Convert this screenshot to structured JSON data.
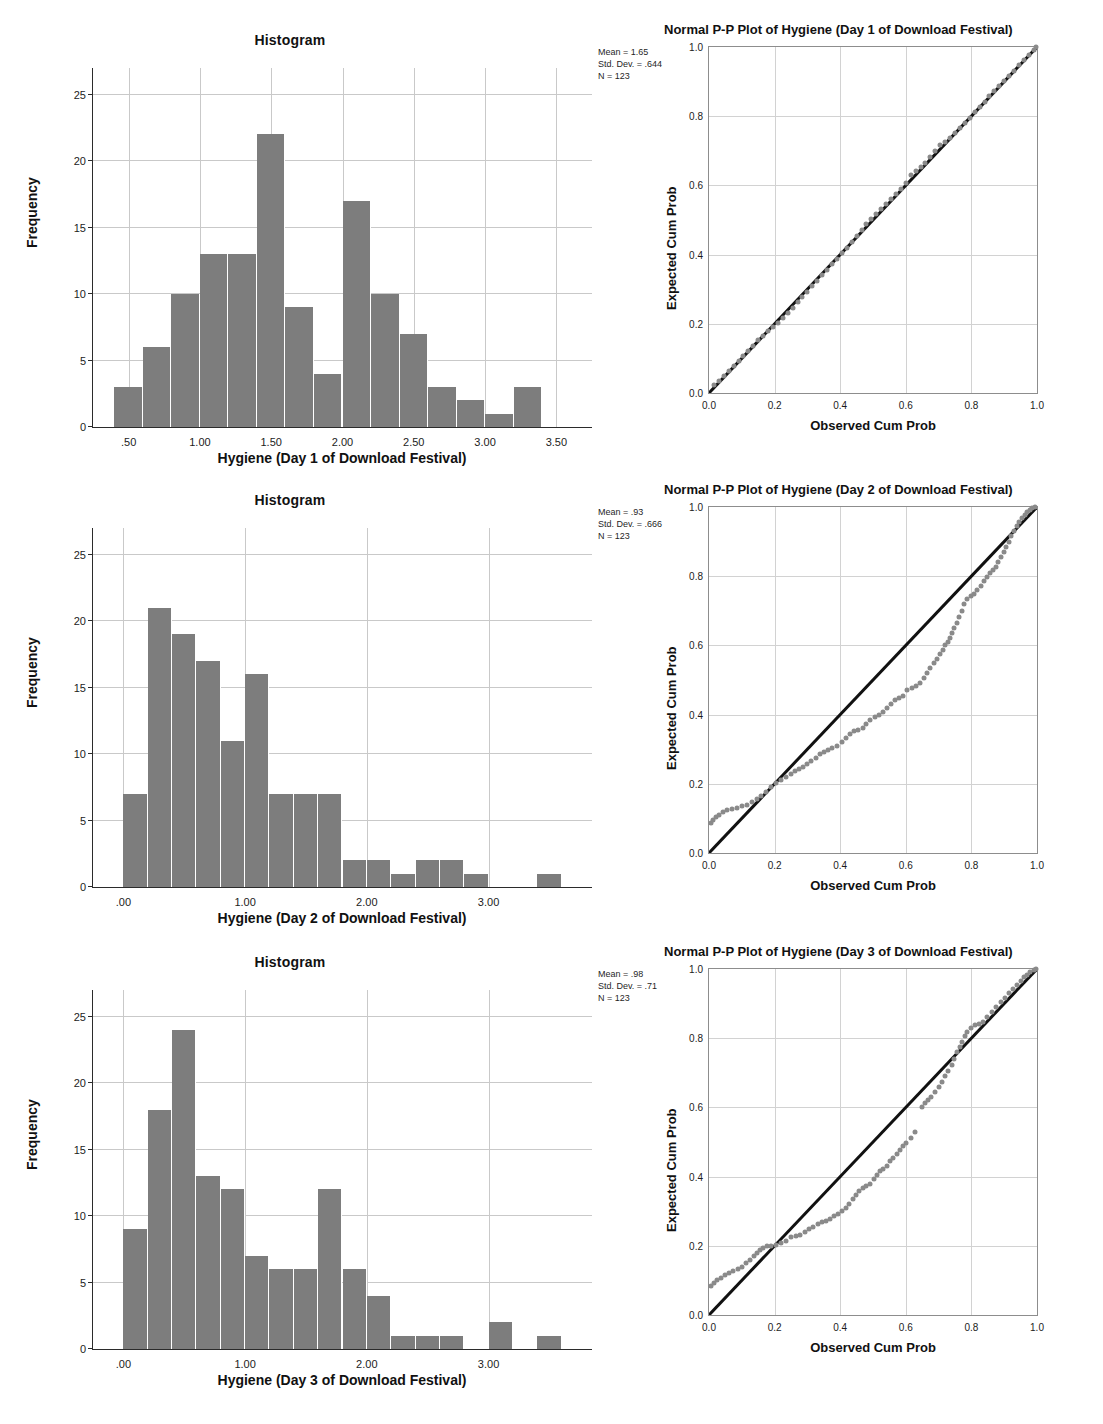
{
  "panels": [
    {
      "histogram": {
        "title": "Histogram",
        "xlabel": "Hygiene (Day 1 of Download Festival)",
        "ylabel": "Frequency",
        "stats": {
          "mean": "Mean = 1.65",
          "sd": "Std. Dev. = .644",
          "n": "N = 123"
        }
      },
      "ppplot": {
        "title": "Normal P-P Plot of Hygiene (Day 1 of Download Festival)",
        "xlabel": "Observed Cum Prob",
        "ylabel": "Expected Cum Prob"
      }
    },
    {
      "histogram": {
        "title": "Histogram",
        "xlabel": "Hygiene (Day 2 of Download Festival)",
        "ylabel": "Frequency",
        "stats": {
          "mean": "Mean = .93",
          "sd": "Std. Dev. = .666",
          "n": "N = 123"
        }
      },
      "ppplot": {
        "title": "Normal P-P Plot of Hygiene (Day 2 of Download Festival)",
        "xlabel": "Observed Cum Prob",
        "ylabel": "Expected Cum Prob"
      }
    },
    {
      "histogram": {
        "title": "Histogram",
        "xlabel": "Hygiene (Day 3 of Download Festival)",
        "ylabel": "Frequency",
        "stats": {
          "mean": "Mean = .98",
          "sd": "Std. Dev. = .71",
          "n": "N = 123"
        }
      },
      "ppplot": {
        "title": "Normal P-P Plot of Hygiene (Day 3 of Download Festival)",
        "xlabel": "Observed Cum Prob",
        "ylabel": "Expected Cum Prob"
      }
    }
  ],
  "chart_data": [
    {
      "type": "bar",
      "title": "Histogram",
      "xlabel": "Hygiene (Day 1 of Download Festival)",
      "ylabel": "Frequency",
      "ylim": [
        0,
        27
      ],
      "yticks": [
        0,
        5,
        10,
        15,
        20,
        25
      ],
      "xlim": [
        0.25,
        3.75
      ],
      "xticks": [
        0.5,
        1.0,
        1.5,
        2.0,
        2.5,
        3.0,
        3.5
      ],
      "xticklabels": [
        ".50",
        "1.00",
        "1.50",
        "2.00",
        "2.50",
        "3.00",
        "3.50"
      ],
      "bin_width": 0.2,
      "bin_starts": [
        0.4,
        0.6,
        0.8,
        1.0,
        1.2,
        1.4,
        1.6,
        1.8,
        2.0,
        2.2,
        2.4,
        2.6,
        2.8,
        3.0,
        3.2
      ],
      "values": [
        3,
        6,
        10,
        13,
        13,
        22,
        9,
        4,
        17,
        10,
        7,
        3,
        2,
        1,
        3
      ],
      "grid": true,
      "annotation": [
        "Mean = 1.65",
        "Std. Dev. = .644",
        "N = 123"
      ]
    },
    {
      "type": "scatter",
      "title": "Normal P-P Plot of Hygiene (Day 1 of Download Festival)",
      "xlabel": "Observed Cum Prob",
      "ylabel": "Expected Cum Prob",
      "xlim": [
        0.0,
        1.0
      ],
      "ylim": [
        0.0,
        1.0
      ],
      "xticks": [
        0.0,
        0.2,
        0.4,
        0.6,
        0.8,
        1.0
      ],
      "yticks": [
        0.0,
        0.2,
        0.4,
        0.6,
        0.8,
        1.0
      ],
      "grid": true,
      "reference_line": [
        [
          0,
          0
        ],
        [
          1,
          1
        ]
      ],
      "points": [
        [
          0.015,
          0.022
        ],
        [
          0.03,
          0.035
        ],
        [
          0.045,
          0.05
        ],
        [
          0.06,
          0.064
        ],
        [
          0.075,
          0.078
        ],
        [
          0.09,
          0.092
        ],
        [
          0.105,
          0.107
        ],
        [
          0.12,
          0.122
        ],
        [
          0.135,
          0.137
        ],
        [
          0.15,
          0.152
        ],
        [
          0.165,
          0.166
        ],
        [
          0.18,
          0.178
        ],
        [
          0.195,
          0.19
        ],
        [
          0.21,
          0.203
        ],
        [
          0.225,
          0.217
        ],
        [
          0.24,
          0.232
        ],
        [
          0.255,
          0.247
        ],
        [
          0.27,
          0.262
        ],
        [
          0.285,
          0.277
        ],
        [
          0.3,
          0.292
        ],
        [
          0.315,
          0.308
        ],
        [
          0.33,
          0.324
        ],
        [
          0.345,
          0.34
        ],
        [
          0.36,
          0.356
        ],
        [
          0.375,
          0.372
        ],
        [
          0.39,
          0.388
        ],
        [
          0.405,
          0.404
        ],
        [
          0.42,
          0.42
        ],
        [
          0.435,
          0.437
        ],
        [
          0.45,
          0.454
        ],
        [
          0.465,
          0.471
        ],
        [
          0.48,
          0.488
        ],
        [
          0.495,
          0.503
        ],
        [
          0.51,
          0.517
        ],
        [
          0.525,
          0.531
        ],
        [
          0.54,
          0.545
        ],
        [
          0.555,
          0.56
        ],
        [
          0.57,
          0.574
        ],
        [
          0.585,
          0.59
        ],
        [
          0.6,
          0.608
        ],
        [
          0.615,
          0.63
        ],
        [
          0.63,
          0.642
        ],
        [
          0.645,
          0.652
        ],
        [
          0.66,
          0.666
        ],
        [
          0.675,
          0.682
        ],
        [
          0.69,
          0.7
        ],
        [
          0.705,
          0.716
        ],
        [
          0.72,
          0.726
        ],
        [
          0.735,
          0.738
        ],
        [
          0.75,
          0.752
        ],
        [
          0.765,
          0.766
        ],
        [
          0.78,
          0.781
        ],
        [
          0.795,
          0.796
        ],
        [
          0.81,
          0.812
        ],
        [
          0.825,
          0.827
        ],
        [
          0.84,
          0.842
        ],
        [
          0.855,
          0.857
        ],
        [
          0.87,
          0.872
        ],
        [
          0.885,
          0.887
        ],
        [
          0.9,
          0.902
        ],
        [
          0.915,
          0.917
        ],
        [
          0.93,
          0.932
        ],
        [
          0.945,
          0.947
        ],
        [
          0.96,
          0.962
        ],
        [
          0.975,
          0.977
        ],
        [
          0.99,
          0.992
        ],
        [
          0.998,
          1.0
        ]
      ]
    },
    {
      "type": "bar",
      "title": "Histogram",
      "xlabel": "Hygiene (Day 2 of Download Festival)",
      "ylabel": "Frequency",
      "ylim": [
        0,
        27
      ],
      "yticks": [
        0,
        5,
        10,
        15,
        20,
        25
      ],
      "xlim": [
        -0.25,
        3.85
      ],
      "xticks": [
        0.0,
        1.0,
        2.0,
        3.0
      ],
      "xticklabels": [
        ".00",
        "1.00",
        "2.00",
        "3.00"
      ],
      "bin_width": 0.2,
      "bin_starts": [
        0.0,
        0.2,
        0.4,
        0.6,
        0.8,
        1.0,
        1.2,
        1.4,
        1.6,
        1.8,
        2.0,
        2.2,
        2.4,
        2.6,
        2.8,
        3.4
      ],
      "values": [
        7,
        21,
        19,
        17,
        11,
        16,
        7,
        7,
        7,
        2,
        2,
        1,
        2,
        2,
        1,
        1
      ],
      "grid": true,
      "annotation": [
        "Mean = .93",
        "Std. Dev. = .666",
        "N = 123"
      ]
    },
    {
      "type": "scatter",
      "title": "Normal P-P Plot of Hygiene (Day 2 of Download Festival)",
      "xlabel": "Observed Cum Prob",
      "ylabel": "Expected Cum Prob",
      "xlim": [
        0.0,
        1.0
      ],
      "ylim": [
        0.0,
        1.0
      ],
      "xticks": [
        0.0,
        0.2,
        0.4,
        0.6,
        0.8,
        1.0
      ],
      "yticks": [
        0.0,
        0.2,
        0.4,
        0.6,
        0.8,
        1.0
      ],
      "grid": true,
      "reference_line": [
        [
          0,
          0
        ],
        [
          1,
          1
        ]
      ],
      "points": [
        [
          0.005,
          0.088
        ],
        [
          0.012,
          0.095
        ],
        [
          0.02,
          0.103
        ],
        [
          0.03,
          0.11
        ],
        [
          0.042,
          0.118
        ],
        [
          0.055,
          0.124
        ],
        [
          0.07,
          0.128
        ],
        [
          0.085,
          0.131
        ],
        [
          0.1,
          0.135
        ],
        [
          0.115,
          0.14
        ],
        [
          0.13,
          0.148
        ],
        [
          0.145,
          0.157
        ],
        [
          0.16,
          0.166
        ],
        [
          0.175,
          0.177
        ],
        [
          0.19,
          0.19
        ],
        [
          0.205,
          0.203
        ],
        [
          0.22,
          0.212
        ],
        [
          0.235,
          0.22
        ],
        [
          0.25,
          0.228
        ],
        [
          0.262,
          0.236
        ],
        [
          0.275,
          0.243
        ],
        [
          0.288,
          0.25
        ],
        [
          0.3,
          0.258
        ],
        [
          0.312,
          0.267
        ],
        [
          0.325,
          0.276
        ],
        [
          0.338,
          0.285
        ],
        [
          0.35,
          0.292
        ],
        [
          0.362,
          0.298
        ],
        [
          0.375,
          0.303
        ],
        [
          0.39,
          0.31
        ],
        [
          0.405,
          0.32
        ],
        [
          0.418,
          0.332
        ],
        [
          0.43,
          0.344
        ],
        [
          0.442,
          0.352
        ],
        [
          0.455,
          0.356
        ],
        [
          0.468,
          0.362
        ],
        [
          0.48,
          0.372
        ],
        [
          0.492,
          0.383
        ],
        [
          0.505,
          0.393
        ],
        [
          0.518,
          0.4
        ],
        [
          0.53,
          0.408
        ],
        [
          0.542,
          0.42
        ],
        [
          0.555,
          0.432
        ],
        [
          0.568,
          0.441
        ],
        [
          0.58,
          0.447
        ],
        [
          0.592,
          0.455
        ],
        [
          0.605,
          0.47
        ],
        [
          0.618,
          0.478
        ],
        [
          0.63,
          0.483
        ],
        [
          0.642,
          0.492
        ],
        [
          0.655,
          0.507
        ],
        [
          0.665,
          0.52
        ],
        [
          0.675,
          0.535
        ],
        [
          0.685,
          0.548
        ],
        [
          0.695,
          0.561
        ],
        [
          0.705,
          0.575
        ],
        [
          0.712,
          0.588
        ],
        [
          0.72,
          0.6
        ],
        [
          0.728,
          0.61
        ],
        [
          0.735,
          0.62
        ],
        [
          0.742,
          0.635
        ],
        [
          0.748,
          0.65
        ],
        [
          0.755,
          0.665
        ],
        [
          0.762,
          0.682
        ],
        [
          0.77,
          0.7
        ],
        [
          0.778,
          0.72
        ],
        [
          0.788,
          0.733
        ],
        [
          0.798,
          0.742
        ],
        [
          0.808,
          0.75
        ],
        [
          0.818,
          0.76
        ],
        [
          0.828,
          0.772
        ],
        [
          0.838,
          0.785
        ],
        [
          0.848,
          0.797
        ],
        [
          0.858,
          0.808
        ],
        [
          0.866,
          0.818
        ],
        [
          0.874,
          0.828
        ],
        [
          0.882,
          0.84
        ],
        [
          0.89,
          0.855
        ],
        [
          0.898,
          0.87
        ],
        [
          0.906,
          0.885
        ],
        [
          0.914,
          0.9
        ],
        [
          0.922,
          0.915
        ],
        [
          0.93,
          0.93
        ],
        [
          0.938,
          0.944
        ],
        [
          0.946,
          0.957
        ],
        [
          0.954,
          0.968
        ],
        [
          0.962,
          0.977
        ],
        [
          0.97,
          0.985
        ],
        [
          0.978,
          0.991
        ],
        [
          0.986,
          0.996
        ],
        [
          0.994,
          0.999
        ]
      ]
    },
    {
      "type": "bar",
      "title": "Histogram",
      "xlabel": "Hygiene (Day 3 of Download Festival)",
      "ylabel": "Frequency",
      "ylim": [
        0,
        27
      ],
      "yticks": [
        0,
        5,
        10,
        15,
        20,
        25
      ],
      "xlim": [
        -0.25,
        3.85
      ],
      "xticks": [
        0.0,
        1.0,
        2.0,
        3.0
      ],
      "xticklabels": [
        ".00",
        "1.00",
        "2.00",
        "3.00"
      ],
      "bin_width": 0.2,
      "bin_starts": [
        0.0,
        0.2,
        0.4,
        0.6,
        0.8,
        1.0,
        1.2,
        1.4,
        1.6,
        1.8,
        2.0,
        2.2,
        2.4,
        2.6,
        3.0,
        3.4
      ],
      "values": [
        9,
        18,
        24,
        13,
        12,
        7,
        6,
        6,
        12,
        6,
        4,
        1,
        1,
        1,
        2,
        1
      ],
      "grid": true,
      "annotation": [
        "Mean = .98",
        "Std. Dev. = .71",
        "N = 123"
      ]
    },
    {
      "type": "scatter",
      "title": "Normal P-P Plot of Hygiene (Day 3 of Download Festival)",
      "xlabel": "Observed Cum Prob",
      "ylabel": "Expected Cum Prob",
      "xlim": [
        0.0,
        1.0
      ],
      "ylim": [
        0.0,
        1.0
      ],
      "xticks": [
        0.0,
        0.2,
        0.4,
        0.6,
        0.8,
        1.0
      ],
      "yticks": [
        0.0,
        0.2,
        0.4,
        0.6,
        0.8,
        1.0
      ],
      "grid": true,
      "reference_line": [
        [
          0,
          0
        ],
        [
          1,
          1
        ]
      ],
      "points": [
        [
          0.005,
          0.085
        ],
        [
          0.014,
          0.092
        ],
        [
          0.024,
          0.1
        ],
        [
          0.036,
          0.108
        ],
        [
          0.048,
          0.115
        ],
        [
          0.06,
          0.122
        ],
        [
          0.074,
          0.128
        ],
        [
          0.088,
          0.133
        ],
        [
          0.102,
          0.14
        ],
        [
          0.114,
          0.15
        ],
        [
          0.126,
          0.16
        ],
        [
          0.136,
          0.17
        ],
        [
          0.146,
          0.18
        ],
        [
          0.156,
          0.188
        ],
        [
          0.166,
          0.194
        ],
        [
          0.176,
          0.198
        ],
        [
          0.19,
          0.2
        ],
        [
          0.205,
          0.203
        ],
        [
          0.22,
          0.208
        ],
        [
          0.235,
          0.215
        ],
        [
          0.25,
          0.224
        ],
        [
          0.265,
          0.228
        ],
        [
          0.278,
          0.232
        ],
        [
          0.292,
          0.24
        ],
        [
          0.305,
          0.248
        ],
        [
          0.318,
          0.255
        ],
        [
          0.332,
          0.262
        ],
        [
          0.345,
          0.268
        ],
        [
          0.358,
          0.272
        ],
        [
          0.37,
          0.278
        ],
        [
          0.382,
          0.285
        ],
        [
          0.394,
          0.292
        ],
        [
          0.406,
          0.302
        ],
        [
          0.418,
          0.31
        ],
        [
          0.428,
          0.322
        ],
        [
          0.438,
          0.334
        ],
        [
          0.448,
          0.348
        ],
        [
          0.458,
          0.358
        ],
        [
          0.468,
          0.366
        ],
        [
          0.478,
          0.372
        ],
        [
          0.49,
          0.38
        ],
        [
          0.502,
          0.392
        ],
        [
          0.512,
          0.405
        ],
        [
          0.522,
          0.415
        ],
        [
          0.532,
          0.422
        ],
        [
          0.542,
          0.432
        ],
        [
          0.552,
          0.445
        ],
        [
          0.562,
          0.455
        ],
        [
          0.572,
          0.465
        ],
        [
          0.582,
          0.478
        ],
        [
          0.592,
          0.488
        ],
        [
          0.602,
          0.497
        ],
        [
          0.615,
          0.512
        ],
        [
          0.628,
          0.53
        ],
        [
          0.648,
          0.6
        ],
        [
          0.658,
          0.612
        ],
        [
          0.668,
          0.622
        ],
        [
          0.678,
          0.63
        ],
        [
          0.69,
          0.645
        ],
        [
          0.7,
          0.658
        ],
        [
          0.71,
          0.672
        ],
        [
          0.72,
          0.69
        ],
        [
          0.73,
          0.705
        ],
        [
          0.74,
          0.722
        ],
        [
          0.748,
          0.74
        ],
        [
          0.756,
          0.76
        ],
        [
          0.764,
          0.775
        ],
        [
          0.772,
          0.79
        ],
        [
          0.78,
          0.805
        ],
        [
          0.788,
          0.818
        ],
        [
          0.798,
          0.83
        ],
        [
          0.81,
          0.838
        ],
        [
          0.822,
          0.842
        ],
        [
          0.835,
          0.848
        ],
        [
          0.848,
          0.86
        ],
        [
          0.862,
          0.875
        ],
        [
          0.876,
          0.89
        ],
        [
          0.89,
          0.905
        ],
        [
          0.902,
          0.917
        ],
        [
          0.914,
          0.93
        ],
        [
          0.926,
          0.942
        ],
        [
          0.938,
          0.955
        ],
        [
          0.95,
          0.966
        ],
        [
          0.96,
          0.976
        ],
        [
          0.97,
          0.984
        ],
        [
          0.98,
          0.991
        ],
        [
          0.99,
          0.996
        ],
        [
          0.998,
          1.0
        ]
      ]
    }
  ]
}
